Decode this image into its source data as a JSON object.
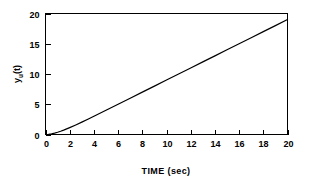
{
  "chart_data": {
    "type": "line",
    "title": "",
    "xlabel": "TIME (sec)",
    "ylabel": "y_u(t)",
    "ylabel_parts": {
      "base": "y",
      "subscript": "u",
      "suffix": "(t)"
    },
    "xlim": [
      0,
      20
    ],
    "ylim": [
      0,
      20
    ],
    "xticks": [
      0,
      2,
      4,
      6,
      8,
      10,
      12,
      14,
      16,
      18,
      20
    ],
    "xtick_labels": [
      "0",
      "2",
      "4",
      "6",
      "8",
      "10",
      "12",
      "14",
      "16",
      "18",
      "20"
    ],
    "yticks": [
      0,
      5,
      10,
      15,
      20
    ],
    "ytick_labels": [
      "0",
      "5",
      "10",
      "15",
      "20"
    ],
    "grid": false,
    "legend": null,
    "frame": "box",
    "tick_direction": "in",
    "line_color": "#000000",
    "axis_color": "#000000",
    "background_color": "#ffffff",
    "series": [
      {
        "name": "y_u(t)",
        "x": [
          0,
          0.25,
          0.5,
          0.75,
          1,
          1.25,
          1.5,
          1.75,
          2,
          2.5,
          3,
          3.5,
          4,
          5,
          6,
          7,
          8,
          9,
          10,
          11,
          12,
          13,
          14,
          15,
          16,
          17,
          18,
          19,
          20
        ],
        "y": [
          0,
          0.029,
          0.107,
          0.222,
          0.368,
          0.537,
          0.723,
          0.924,
          1.135,
          1.582,
          2.05,
          2.53,
          3.018,
          4.007,
          5.002,
          6.001,
          7.0,
          8.0,
          9.0,
          10.0,
          11.0,
          12.0,
          13.0,
          14.0,
          15.0,
          16.0,
          17.0,
          18.0,
          19.0
        ]
      }
    ]
  }
}
